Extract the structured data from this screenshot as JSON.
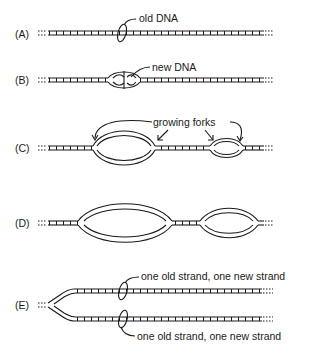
{
  "diagram": {
    "panels": [
      {
        "id": "A",
        "label": "(A)",
        "annotation": "old DNA"
      },
      {
        "id": "B",
        "label": "(B)",
        "annotation": "new DNA"
      },
      {
        "id": "C",
        "label": "(C)",
        "annotation": "growing forks"
      },
      {
        "id": "D",
        "label": "(D)",
        "annotation": ""
      },
      {
        "id": "E",
        "label": "(E)",
        "annotation_top": "one old strand, one new strand",
        "annotation_bottom": "one old strand, one new strand"
      }
    ],
    "colors": {
      "ink": "#1a1a1a",
      "background": "#ffffff"
    }
  }
}
